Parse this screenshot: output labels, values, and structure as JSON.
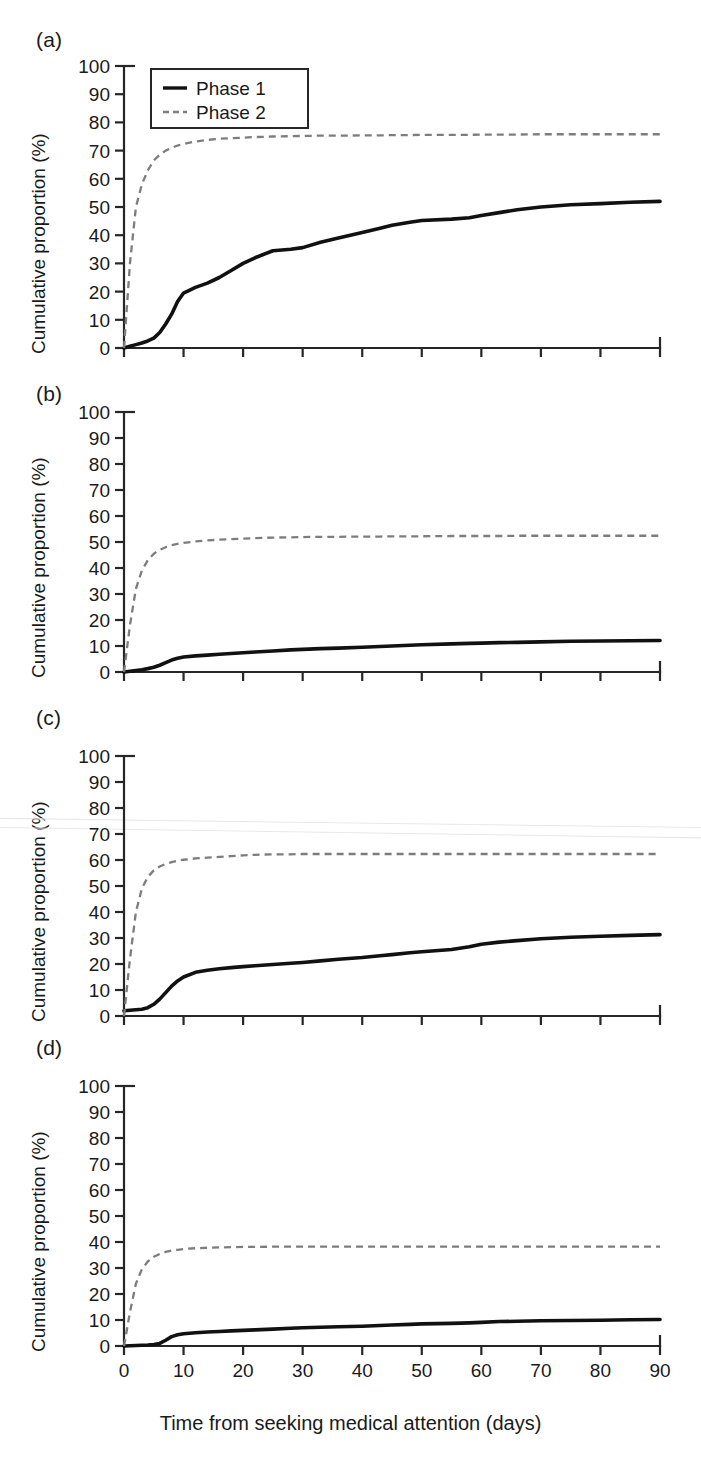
{
  "figure": {
    "xlabel": "Time from seeking medical attention (days)",
    "ylabel": "Cumulative proportion (%)",
    "panel_tags": [
      "(a)",
      "(b)",
      "(c)",
      "(d)"
    ],
    "legend": {
      "items": [
        {
          "label": "Phase 1",
          "style": "solid",
          "color": "#111111"
        },
        {
          "label": "Phase 2",
          "style": "dashed",
          "color": "#7d7d7d"
        }
      ]
    },
    "xticks": [
      0,
      10,
      20,
      30,
      40,
      50,
      60,
      70,
      80,
      90
    ],
    "yticks": [
      0,
      10,
      20,
      30,
      40,
      50,
      60,
      70,
      80,
      90,
      100
    ],
    "xlim": [
      0,
      90
    ],
    "ylim": [
      0,
      100
    ],
    "grid": false
  },
  "chart_data": [
    {
      "type": "line",
      "panel": "(a)",
      "title": "",
      "xlabel": "Time from seeking medical attention (days)",
      "ylabel": "Cumulative proportion (%)",
      "xlim": [
        0,
        90
      ],
      "ylim": [
        0,
        100
      ],
      "xticks": [
        0,
        10,
        20,
        30,
        40,
        50,
        60,
        70,
        80,
        90
      ],
      "yticks": [
        0,
        10,
        20,
        30,
        40,
        50,
        60,
        70,
        80,
        90,
        100
      ],
      "legend_position": "top-left",
      "grid": false,
      "x": [
        0,
        1,
        2,
        3,
        4,
        5,
        6,
        7,
        8,
        9,
        10,
        12,
        14,
        16,
        18,
        20,
        22,
        25,
        28,
        30,
        33,
        36,
        40,
        43,
        45,
        48,
        50,
        55,
        58,
        60,
        63,
        66,
        70,
        75,
        80,
        85,
        90
      ],
      "series": [
        {
          "name": "Phase 1",
          "style": "solid",
          "values": [
            0,
            0.6,
            1.2,
            1.8,
            2.5,
            3.5,
            5.5,
            8.5,
            12.0,
            16.5,
            19.5,
            21.5,
            23.0,
            25.0,
            27.5,
            30.0,
            32.0,
            34.5,
            35.0,
            35.6,
            37.5,
            39.0,
            41.0,
            42.5,
            43.5,
            44.6,
            45.2,
            45.7,
            46.2,
            47.0,
            48.0,
            49.0,
            50.0,
            50.8,
            51.2,
            51.7,
            52.0
          ]
        },
        {
          "name": "Phase 2",
          "style": "dashed",
          "values": [
            0,
            30.0,
            50.0,
            58.0,
            63.0,
            66.5,
            68.5,
            70.0,
            71.0,
            71.8,
            72.4,
            73.2,
            73.8,
            74.2,
            74.4,
            74.6,
            74.8,
            75.0,
            75.1,
            75.2,
            75.3,
            75.3,
            75.4,
            75.4,
            75.5,
            75.5,
            75.6,
            75.6,
            75.6,
            75.7,
            75.7,
            75.7,
            75.8,
            75.8,
            75.8,
            75.8,
            75.8
          ]
        }
      ]
    },
    {
      "type": "line",
      "panel": "(b)",
      "title": "",
      "xlabel": "Time from seeking medical attention (days)",
      "ylabel": "Cumulative proportion (%)",
      "xlim": [
        0,
        90
      ],
      "ylim": [
        0,
        100
      ],
      "xticks": [
        0,
        10,
        20,
        30,
        40,
        50,
        60,
        70,
        80,
        90
      ],
      "yticks": [
        0,
        10,
        20,
        30,
        40,
        50,
        60,
        70,
        80,
        90,
        100
      ],
      "legend_position": "none",
      "grid": false,
      "x": [
        0,
        1,
        2,
        3,
        4,
        5,
        6,
        7,
        8,
        9,
        10,
        12,
        14,
        16,
        18,
        20,
        22,
        25,
        28,
        30,
        33,
        36,
        40,
        43,
        45,
        48,
        50,
        55,
        58,
        60,
        63,
        66,
        70,
        75,
        80,
        85,
        90
      ],
      "series": [
        {
          "name": "Phase 1",
          "style": "solid",
          "values": [
            0,
            0.3,
            0.6,
            0.9,
            1.3,
            1.8,
            2.6,
            3.6,
            4.6,
            5.3,
            5.8,
            6.2,
            6.5,
            6.8,
            7.1,
            7.4,
            7.7,
            8.1,
            8.5,
            8.7,
            9.0,
            9.2,
            9.5,
            9.8,
            10.0,
            10.3,
            10.5,
            10.8,
            11.0,
            11.1,
            11.3,
            11.4,
            11.6,
            11.8,
            11.9,
            12.0,
            12.1
          ]
        },
        {
          "name": "Phase 2",
          "style": "dashed",
          "values": [
            0,
            18.0,
            32.0,
            39.0,
            43.0,
            45.5,
            47.0,
            48.0,
            48.8,
            49.3,
            49.7,
            50.2,
            50.6,
            50.9,
            51.1,
            51.3,
            51.5,
            51.7,
            51.8,
            51.9,
            52.0,
            52.0,
            52.1,
            52.1,
            52.2,
            52.2,
            52.2,
            52.3,
            52.3,
            52.3,
            52.3,
            52.4,
            52.4,
            52.4,
            52.4,
            52.4,
            52.4
          ]
        }
      ]
    },
    {
      "type": "line",
      "panel": "(c)",
      "title": "",
      "xlabel": "Time from seeking medical attention (days)",
      "ylabel": "Cumulative proportion (%)",
      "xlim": [
        0,
        90
      ],
      "ylim": [
        0,
        100
      ],
      "xticks": [
        0,
        10,
        20,
        30,
        40,
        50,
        60,
        70,
        80,
        90
      ],
      "yticks": [
        0,
        10,
        20,
        30,
        40,
        50,
        60,
        70,
        80,
        90,
        100
      ],
      "legend_position": "none",
      "grid": false,
      "x": [
        0,
        1,
        2,
        3,
        4,
        5,
        6,
        7,
        8,
        9,
        10,
        12,
        14,
        16,
        18,
        20,
        22,
        25,
        28,
        30,
        33,
        36,
        40,
        43,
        45,
        48,
        50,
        55,
        58,
        60,
        63,
        66,
        70,
        75,
        80,
        85,
        90
      ],
      "series": [
        {
          "name": "Phase 1",
          "style": "solid",
          "values": [
            2.0,
            2.2,
            2.4,
            2.6,
            3.2,
            4.5,
            6.5,
            9.0,
            11.5,
            13.5,
            15.0,
            16.8,
            17.6,
            18.2,
            18.6,
            19.0,
            19.3,
            19.8,
            20.3,
            20.6,
            21.2,
            21.8,
            22.5,
            23.2,
            23.6,
            24.3,
            24.7,
            25.6,
            26.6,
            27.6,
            28.4,
            29.0,
            29.7,
            30.3,
            30.7,
            31.0,
            31.3
          ]
        },
        {
          "name": "Phase 2",
          "style": "dashed",
          "values": [
            0,
            22.0,
            40.0,
            49.0,
            53.5,
            56.0,
            57.5,
            58.5,
            59.2,
            59.7,
            60.1,
            60.6,
            60.9,
            61.2,
            61.5,
            61.8,
            62.0,
            62.2,
            62.2,
            62.3,
            62.3,
            62.3,
            62.3,
            62.3,
            62.3,
            62.3,
            62.3,
            62.3,
            62.3,
            62.3,
            62.3,
            62.3,
            62.3,
            62.3,
            62.3,
            62.3,
            62.3
          ]
        }
      ]
    },
    {
      "type": "line",
      "panel": "(d)",
      "title": "",
      "xlabel": "Time from seeking medical attention (days)",
      "ylabel": "Cumulative proportion (%)",
      "xlim": [
        0,
        90
      ],
      "ylim": [
        0,
        100
      ],
      "xticks": [
        0,
        10,
        20,
        30,
        40,
        50,
        60,
        70,
        80,
        90
      ],
      "yticks": [
        0,
        10,
        20,
        30,
        40,
        50,
        60,
        70,
        80,
        90,
        100
      ],
      "legend_position": "none",
      "grid": false,
      "x": [
        0,
        1,
        2,
        3,
        4,
        5,
        6,
        7,
        8,
        9,
        10,
        12,
        14,
        16,
        18,
        20,
        22,
        25,
        28,
        30,
        33,
        36,
        40,
        43,
        45,
        48,
        50,
        55,
        58,
        60,
        63,
        66,
        70,
        75,
        80,
        85,
        90
      ],
      "series": [
        {
          "name": "Phase 1",
          "style": "solid",
          "values": [
            0,
            0.1,
            0.2,
            0.3,
            0.4,
            0.6,
            1.0,
            2.2,
            3.6,
            4.3,
            4.7,
            5.1,
            5.4,
            5.6,
            5.8,
            6.0,
            6.2,
            6.5,
            6.8,
            7.0,
            7.2,
            7.4,
            7.6,
            7.9,
            8.1,
            8.3,
            8.5,
            8.7,
            8.9,
            9.1,
            9.4,
            9.5,
            9.7,
            9.8,
            9.9,
            10.1,
            10.2
          ]
        },
        {
          "name": "Phase 2",
          "style": "dashed",
          "values": [
            0,
            13.0,
            24.0,
            29.5,
            32.5,
            34.3,
            35.4,
            36.2,
            36.7,
            37.0,
            37.3,
            37.6,
            37.8,
            37.9,
            38.0,
            38.1,
            38.1,
            38.2,
            38.2,
            38.2,
            38.2,
            38.2,
            38.2,
            38.2,
            38.2,
            38.2,
            38.2,
            38.2,
            38.2,
            38.2,
            38.2,
            38.2,
            38.2,
            38.2,
            38.2,
            38.2,
            38.2
          ]
        }
      ]
    }
  ]
}
